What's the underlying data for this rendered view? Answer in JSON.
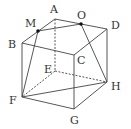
{
  "vertices": {
    "A": {
      "x": 55,
      "y": 19,
      "label": "A",
      "lx": 50,
      "ly": 13
    },
    "B": {
      "x": 22,
      "y": 43,
      "label": "B",
      "lx": 8,
      "ly": 48
    },
    "C": {
      "x": 74,
      "y": 55,
      "label": "C",
      "lx": 77,
      "ly": 64
    },
    "D": {
      "x": 107,
      "y": 29,
      "label": "D",
      "lx": 111,
      "ly": 29
    },
    "E": {
      "x": 55,
      "y": 71,
      "label": "E",
      "lx": 44,
      "ly": 73
    },
    "F": {
      "x": 22,
      "y": 97,
      "label": "F",
      "lx": 9,
      "ly": 104
    },
    "G": {
      "x": 74,
      "y": 109,
      "label": "G",
      "lx": 70,
      "ly": 124
    },
    "H": {
      "x": 107,
      "y": 82,
      "label": "H",
      "lx": 111,
      "ly": 90
    },
    "M": {
      "x": 38,
      "y": 31,
      "label": "M",
      "lx": 25,
      "ly": 27
    },
    "O": {
      "x": 81,
      "y": 24,
      "label": "O",
      "lx": 77,
      "ly": 19
    }
  },
  "solid_edges": [
    [
      "A",
      "B"
    ],
    [
      "A",
      "D"
    ],
    [
      "B",
      "C"
    ],
    [
      "C",
      "D"
    ],
    [
      "B",
      "F"
    ],
    [
      "C",
      "G"
    ],
    [
      "D",
      "H"
    ],
    [
      "F",
      "G"
    ],
    [
      "G",
      "H"
    ],
    [
      "M",
      "O"
    ],
    [
      "M",
      "F"
    ],
    [
      "O",
      "H"
    ],
    [
      "F",
      "H"
    ]
  ],
  "dashed_edges": [
    [
      "A",
      "E"
    ],
    [
      "E",
      "F"
    ],
    [
      "E",
      "H"
    ]
  ],
  "marked_points": [
    "M",
    "O"
  ]
}
